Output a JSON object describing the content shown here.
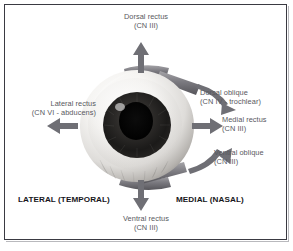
{
  "colors": {
    "border": "#3a3a42",
    "background": "#ffffff",
    "label_text": "#58585e",
    "axis_text": "#16161a",
    "arrow": "#6f6f75",
    "muscle_band": "#7e7e84",
    "sclera_light": "#f4f3f1",
    "sclera_shadow": "#a9a7a4",
    "iris": "#2b2a28",
    "pupil": "#050505"
  },
  "labels": {
    "dorsal_rectus": {
      "name": "Dorsal rectus",
      "nerve": "(CN III)"
    },
    "ventral_rectus": {
      "name": "Ventral rectus",
      "nerve": "(CN III)"
    },
    "lateral_rectus": {
      "name": "Lateral rectus",
      "nerve": "(CN VI - abducens)"
    },
    "medial_rectus": {
      "name": "Medial rectus",
      "nerve": "(CN III)"
    },
    "dorsal_oblique": {
      "name": "Dorsal oblique",
      "nerve": "(CN IV - trochlear)"
    },
    "ventral_oblique": {
      "name": "Ventral oblique",
      "nerve": "(CN III)"
    }
  },
  "orientation": {
    "lateral": "LATERAL (TEMPORAL)",
    "medial": "MEDIAL (NASAL)"
  },
  "arrows": {
    "up": "arrow-up-icon",
    "down": "arrow-down-icon",
    "left": "arrow-left-icon",
    "right": "arrow-right-icon",
    "curved_down_right": "curved-arrow-down-right-icon",
    "curved_up_right": "curved-arrow-up-right-icon"
  }
}
